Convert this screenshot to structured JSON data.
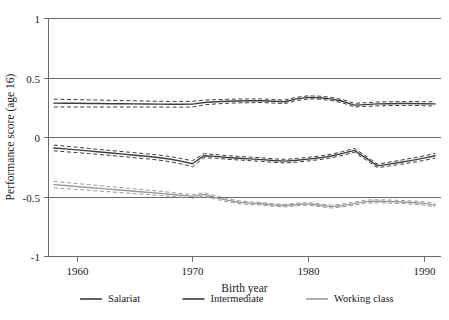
{
  "chart_data": {
    "type": "line",
    "title": "",
    "xlabel": "Birth year",
    "ylabel": "Performance score (age 16)",
    "xlim": [
      1957.5,
      1991.5
    ],
    "ylim": [
      -1,
      1
    ],
    "xticks": [
      1960,
      1970,
      1980,
      1990
    ],
    "xticklabels": [
      "1960",
      "1970",
      "1980",
      "1990"
    ],
    "yticks": [
      1,
      0.5,
      0,
      -0.5,
      -1
    ],
    "yticklabels": [
      "1",
      "0.5",
      "0",
      "-0.5",
      "-1"
    ],
    "grid": "horizontal",
    "legend_position": "bottom",
    "x": [
      1958,
      1959,
      1960,
      1961,
      1962,
      1963,
      1964,
      1965,
      1966,
      1967,
      1968,
      1969,
      1970,
      1971,
      1972,
      1973,
      1974,
      1975,
      1976,
      1977,
      1978,
      1979,
      1980,
      1981,
      1982,
      1983,
      1984,
      1985,
      1986,
      1987,
      1988,
      1989,
      1990,
      1991
    ],
    "series": [
      {
        "name": "Salariat",
        "color": "#3d3d3d",
        "values": [
          0.285,
          0.284,
          0.283,
          0.282,
          0.281,
          0.28,
          0.279,
          0.278,
          0.277,
          0.276,
          0.275,
          0.275,
          0.276,
          0.29,
          0.296,
          0.3,
          0.303,
          0.304,
          0.305,
          0.3,
          0.296,
          0.32,
          0.333,
          0.33,
          0.32,
          0.3,
          0.268,
          0.272,
          0.278,
          0.28,
          0.281,
          0.282,
          0.28,
          0.278
        ],
        "ci_upper": [
          0.318,
          0.316,
          0.314,
          0.312,
          0.31,
          0.308,
          0.306,
          0.304,
          0.302,
          0.3,
          0.299,
          0.299,
          0.3,
          0.31,
          0.314,
          0.317,
          0.319,
          0.32,
          0.32,
          0.315,
          0.311,
          0.334,
          0.346,
          0.343,
          0.333,
          0.314,
          0.283,
          0.288,
          0.294,
          0.296,
          0.297,
          0.298,
          0.297,
          0.296
        ],
        "ci_lower": [
          0.252,
          0.252,
          0.252,
          0.252,
          0.252,
          0.252,
          0.252,
          0.252,
          0.252,
          0.252,
          0.251,
          0.251,
          0.252,
          0.27,
          0.278,
          0.283,
          0.287,
          0.288,
          0.29,
          0.285,
          0.281,
          0.306,
          0.32,
          0.317,
          0.307,
          0.286,
          0.253,
          0.256,
          0.262,
          0.264,
          0.265,
          0.266,
          0.263,
          0.26
        ]
      },
      {
        "name": "Intermediate",
        "color": "#3d3d3d",
        "values": [
          -0.092,
          -0.1,
          -0.108,
          -0.117,
          -0.126,
          -0.135,
          -0.144,
          -0.153,
          -0.162,
          -0.172,
          -0.185,
          -0.203,
          -0.225,
          -0.157,
          -0.163,
          -0.172,
          -0.178,
          -0.184,
          -0.19,
          -0.198,
          -0.203,
          -0.196,
          -0.186,
          -0.175,
          -0.16,
          -0.138,
          -0.112,
          -0.176,
          -0.243,
          -0.228,
          -0.212,
          -0.196,
          -0.178,
          -0.158
        ],
        "ci_upper": [
          -0.068,
          -0.077,
          -0.086,
          -0.096,
          -0.105,
          -0.114,
          -0.123,
          -0.132,
          -0.141,
          -0.151,
          -0.163,
          -0.18,
          -0.2,
          -0.14,
          -0.148,
          -0.157,
          -0.163,
          -0.169,
          -0.175,
          -0.183,
          -0.188,
          -0.181,
          -0.171,
          -0.16,
          -0.145,
          -0.122,
          -0.095,
          -0.16,
          -0.228,
          -0.212,
          -0.195,
          -0.178,
          -0.159,
          -0.138
        ],
        "ci_lower": [
          -0.116,
          -0.124,
          -0.131,
          -0.139,
          -0.147,
          -0.156,
          -0.165,
          -0.174,
          -0.183,
          -0.193,
          -0.207,
          -0.226,
          -0.25,
          -0.174,
          -0.178,
          -0.187,
          -0.193,
          -0.199,
          -0.205,
          -0.213,
          -0.218,
          -0.211,
          -0.201,
          -0.19,
          -0.175,
          -0.154,
          -0.129,
          -0.192,
          -0.258,
          -0.244,
          -0.229,
          -0.214,
          -0.197,
          -0.178
        ]
      },
      {
        "name": "Working class",
        "color": "#9a9a9a",
        "values": [
          -0.4,
          -0.408,
          -0.416,
          -0.424,
          -0.432,
          -0.44,
          -0.448,
          -0.456,
          -0.464,
          -0.472,
          -0.481,
          -0.49,
          -0.499,
          -0.483,
          -0.508,
          -0.53,
          -0.548,
          -0.556,
          -0.561,
          -0.572,
          -0.576,
          -0.567,
          -0.562,
          -0.573,
          -0.585,
          -0.575,
          -0.56,
          -0.543,
          -0.54,
          -0.542,
          -0.546,
          -0.551,
          -0.558,
          -0.572
        ],
        "ci_upper": [
          -0.373,
          -0.382,
          -0.391,
          -0.4,
          -0.409,
          -0.418,
          -0.427,
          -0.436,
          -0.445,
          -0.454,
          -0.464,
          -0.474,
          -0.484,
          -0.468,
          -0.494,
          -0.517,
          -0.536,
          -0.545,
          -0.55,
          -0.561,
          -0.565,
          -0.556,
          -0.551,
          -0.561,
          -0.573,
          -0.563,
          -0.547,
          -0.53,
          -0.527,
          -0.529,
          -0.533,
          -0.538,
          -0.544,
          -0.557
        ],
        "ci_lower": [
          -0.427,
          -0.434,
          -0.441,
          -0.448,
          -0.455,
          -0.462,
          -0.469,
          -0.476,
          -0.483,
          -0.49,
          -0.498,
          -0.506,
          -0.514,
          -0.498,
          -0.522,
          -0.543,
          -0.56,
          -0.567,
          -0.572,
          -0.583,
          -0.587,
          -0.578,
          -0.573,
          -0.585,
          -0.597,
          -0.587,
          -0.573,
          -0.556,
          -0.553,
          -0.555,
          -0.559,
          -0.564,
          -0.572,
          -0.587
        ]
      }
    ],
    "legend": [
      {
        "label": "Salariat",
        "color": "#3d3d3d"
      },
      {
        "label": "Intermediate",
        "color": "#3d3d3d"
      },
      {
        "label": "Working class",
        "color": "#9a9a9a"
      }
    ]
  }
}
